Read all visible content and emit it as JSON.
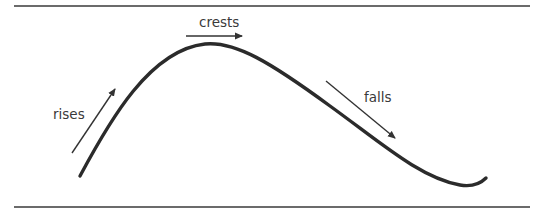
{
  "diagram": {
    "title": "",
    "phases": [
      {
        "id": "rises",
        "label": "rises",
        "direction": "up-right"
      },
      {
        "id": "crests",
        "label": "crests",
        "direction": "right"
      },
      {
        "id": "falls",
        "label": "falls",
        "direction": "down-right"
      }
    ],
    "colors": {
      "curve": "#2b2b2b",
      "arrows": "#333333",
      "text": "#3a3a3a",
      "rules": "#3a3a3a",
      "background": "#ffffff"
    }
  }
}
